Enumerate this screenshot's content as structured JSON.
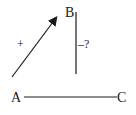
{
  "diagram": {
    "nodes": {
      "A": {
        "label": "A"
      },
      "B": {
        "label": "B"
      },
      "C": {
        "label": "C"
      }
    },
    "edges": [
      {
        "from": "A",
        "to": "B",
        "type": "arrow",
        "sign": "+"
      },
      {
        "from": "B",
        "to": "B-down",
        "type": "line",
        "sign": "–?"
      },
      {
        "from": "A",
        "to": "C",
        "type": "line",
        "sign": ""
      }
    ],
    "labels": {
      "plus": "+",
      "minus_question": "–?"
    },
    "colors": {
      "stroke": "#1a1a1a",
      "background": "#ffffff"
    }
  }
}
